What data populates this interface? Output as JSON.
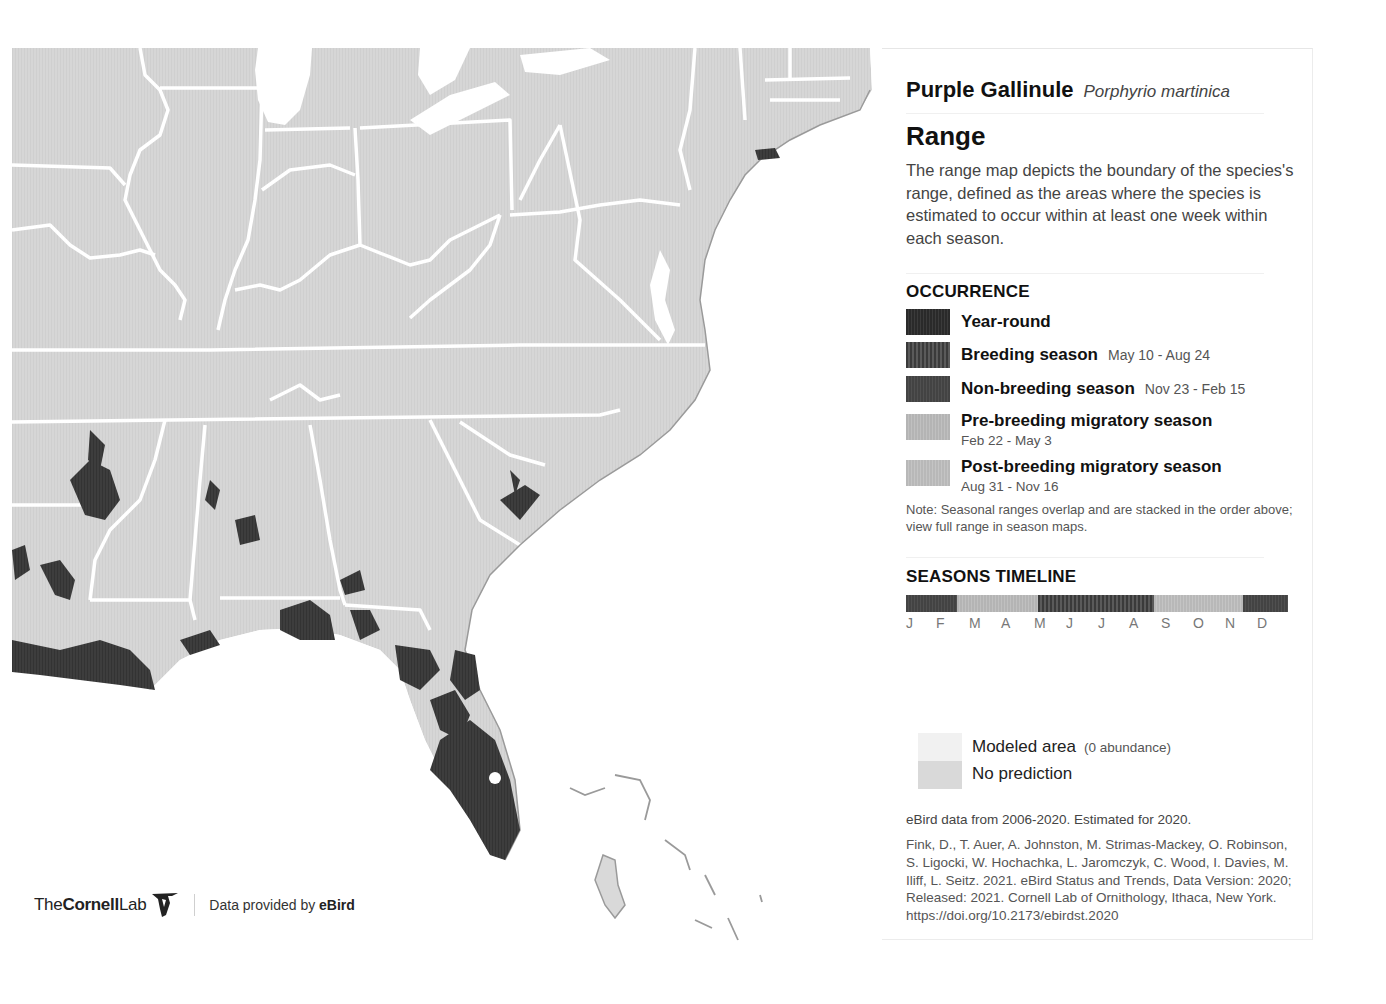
{
  "species": {
    "common_name": "Purple Gallinule",
    "scientific_name": "Porphyrio martinica"
  },
  "range": {
    "heading": "Range",
    "description": "The range map depicts the boundary of the species's range, defined as the areas where the species is estimated to occur within at least one week within each season."
  },
  "occurrence": {
    "heading": "OCCURRENCE",
    "items": [
      {
        "label": "Year-round",
        "dates": "",
        "color": "#2e2e2e"
      },
      {
        "label": "Breeding season",
        "dates": "May 10 - Aug 24",
        "color": "#484848"
      },
      {
        "label": "Non-breeding season",
        "dates": "Nov 23 - Feb 15",
        "color": "#474747"
      },
      {
        "label": "Pre-breeding migratory season",
        "dates": "Feb 22 - May 3",
        "color": "#b9b9b9"
      },
      {
        "label": "Post-breeding migratory season",
        "dates": "Aug 31 - Nov 16",
        "color": "#bcbcbc"
      }
    ],
    "note": "Note: Seasonal ranges overlap and are stacked in the order above; view full range in season maps."
  },
  "seasons_timeline": {
    "heading": "SEASONS TIMELINE",
    "months": [
      "J",
      "F",
      "M",
      "A",
      "M",
      "J",
      "J",
      "A",
      "S",
      "O",
      "N",
      "D"
    ],
    "segments": [
      {
        "season": "non-breeding",
        "start_frac": 0.0,
        "end_frac": 0.134
      },
      {
        "season": "pre-breeding",
        "start_frac": 0.134,
        "end_frac": 0.346
      },
      {
        "season": "breeding",
        "start_frac": 0.346,
        "end_frac": 0.65
      },
      {
        "season": "post-breeding",
        "start_frac": 0.65,
        "end_frac": 0.885
      },
      {
        "season": "non-breeding",
        "start_frac": 0.885,
        "end_frac": 1.0
      }
    ]
  },
  "model_legend": {
    "modeled_area": "Modeled area",
    "modeled_area_note": "(0 abundance)",
    "no_prediction": "No prediction",
    "modeled_color": "#f1f1f1",
    "no_prediction_color": "#d9d9d9"
  },
  "data_info": {
    "years": "eBird data from 2006-2020. Estimated for 2020.",
    "citation": "Fink, D., T. Auer, A. Johnston, M. Strimas-Mackey, O. Robinson, S. Ligocki, W. Hochachka, L. Jaromczyk, C. Wood, I. Davies, M. Iliff, L. Seitz. 2021. eBird Status and Trends, Data Version: 2020; Released: 2021. Cornell Lab of Ornithology, Ithaca, New York.",
    "doi": "https://doi.org/10.2173/ebirdst.2020"
  },
  "credits": {
    "lab_prefix": "The",
    "lab_bold": "Cornell",
    "lab_suffix": "Lab",
    "provided_by": "Data provided by",
    "provider": "eBird"
  },
  "map": {
    "land_color": "#d6d6d6",
    "border_color": "#ffffff",
    "water_color": "#ffffff",
    "range_color": "#3d3d3d"
  }
}
